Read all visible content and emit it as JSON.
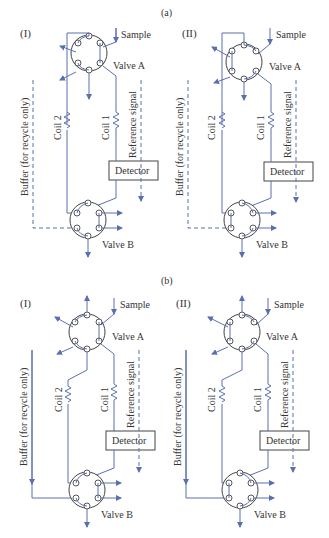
{
  "figure": {
    "sections": [
      {
        "id": "a",
        "label": "(a)",
        "panels": [
          {
            "id": "a-I",
            "label": "(I)",
            "sample_label": "Sample",
            "valve_a_label": "Valve A",
            "valve_b_label": "Valve B",
            "coil1_label": "Coil 1",
            "coil2_label": "Coil 2",
            "detector_label": "Detector",
            "reference_label": "Reference signal",
            "buffer_label": "Buffer (for recycle only)"
          },
          {
            "id": "a-II",
            "label": "(II)",
            "sample_label": "Sample",
            "valve_a_label": "Valve A",
            "valve_b_label": "Valve B",
            "coil1_label": "Coil 1",
            "coil2_label": "Coil 2",
            "detector_label": "Detector",
            "reference_label": "Reference signal",
            "buffer_label": "Buffer (for recycle only)"
          }
        ]
      },
      {
        "id": "b",
        "label": "(b)",
        "panels": [
          {
            "id": "b-I",
            "label": "(I)",
            "sample_label": "Sample",
            "valve_a_label": "Valve A",
            "valve_b_label": "Valve B",
            "coil1_label": "Coil 1",
            "coil2_label": "Coil 2",
            "detector_label": "Detector",
            "reference_label": "Reference signal",
            "buffer_label": "Buffer (for recycle only)"
          },
          {
            "id": "b-II",
            "label": "(II)",
            "sample_label": "Sample",
            "valve_a_label": "Valve A",
            "valve_b_label": "Valve B",
            "coil1_label": "Coil 1",
            "coil2_label": "Coil 2",
            "detector_label": "Detector",
            "reference_label": "Reference signal",
            "buffer_label": "Buffer (for recycle only)"
          }
        ]
      }
    ]
  },
  "colors": {
    "pipe": "#5a6fb0",
    "outline": "#444444",
    "text": "#333333"
  }
}
